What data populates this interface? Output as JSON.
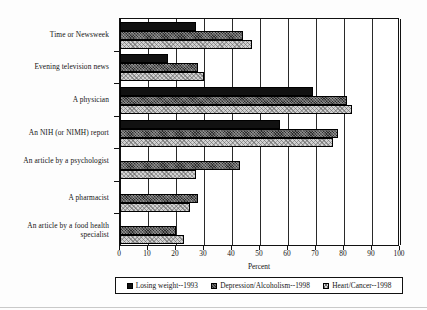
{
  "chart_data": {
    "type": "bar",
    "orientation": "horizontal",
    "title": "",
    "xlabel": "Percent",
    "ylabel": "",
    "xlim": [
      0,
      100
    ],
    "xticks": [
      0,
      10,
      20,
      30,
      40,
      50,
      60,
      70,
      80,
      90,
      100
    ],
    "grid": true,
    "grid_axis": "x",
    "legend_position": "bottom",
    "categories": [
      "Time or Newsweek",
      "Evening television news",
      "A physician",
      "An NIH (or NIMH) report",
      "An article by a psychologist",
      "A pharmacist",
      "An article by a food health specialist"
    ],
    "series": [
      {
        "name": "Losing weight--1993",
        "color": "#111111",
        "pattern": "solid-black",
        "values": [
          27,
          17,
          69,
          57,
          0,
          0,
          0
        ]
      },
      {
        "name": "Depression/Alcoholism--1998",
        "color": "#2b2b2b",
        "pattern": "dark-crosshatch",
        "values": [
          44,
          28,
          81,
          78,
          43,
          28,
          20
        ]
      },
      {
        "name": "Heart/Cancer--1998",
        "color": "#d2d2d2",
        "pattern": "light-crosshatch",
        "values": [
          47,
          30,
          83,
          76,
          27,
          25,
          23
        ]
      }
    ]
  },
  "axis": {
    "x_title": "Percent",
    "tick_labels": [
      "0",
      "10",
      "20",
      "30",
      "40",
      "50",
      "60",
      "70",
      "80",
      "90",
      "100"
    ]
  },
  "legend": {
    "items": [
      {
        "label": "Losing weight--1993",
        "swatch": "solid-black-swatch"
      },
      {
        "label": "Depression/Alcoholism--1998",
        "swatch": "dark-crosshatch-swatch"
      },
      {
        "label": "Heart/Cancer--1998",
        "swatch": "light-crosshatch-swatch"
      }
    ]
  }
}
